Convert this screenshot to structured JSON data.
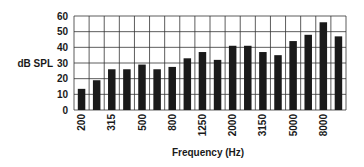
{
  "chart_data": {
    "type": "bar",
    "title": "",
    "xlabel": "Frequency (Hz)",
    "ylabel": "dB SPL",
    "ylim": [
      0,
      60
    ],
    "yticks": [
      0,
      10,
      20,
      30,
      40,
      50,
      60
    ],
    "grid": true,
    "legend": null,
    "categories": [
      "200",
      "250",
      "315",
      "400",
      "500",
      "630",
      "800",
      "1000",
      "1250",
      "1600",
      "2000",
      "2500",
      "3150",
      "4000",
      "5000",
      "6300",
      "8000",
      "10000"
    ],
    "xtick_labels_shown": [
      "200",
      "315",
      "500",
      "800",
      "1250",
      "2000",
      "3150",
      "5000",
      "8000"
    ],
    "values": [
      13.5,
      19,
      26,
      26,
      29,
      26,
      27.5,
      33,
      37,
      32,
      41,
      41,
      37,
      35,
      44,
      48,
      56,
      47
    ],
    "colors": {
      "bar": "#1a1a1a",
      "grid": "#333333",
      "background": "#ffffff"
    }
  }
}
